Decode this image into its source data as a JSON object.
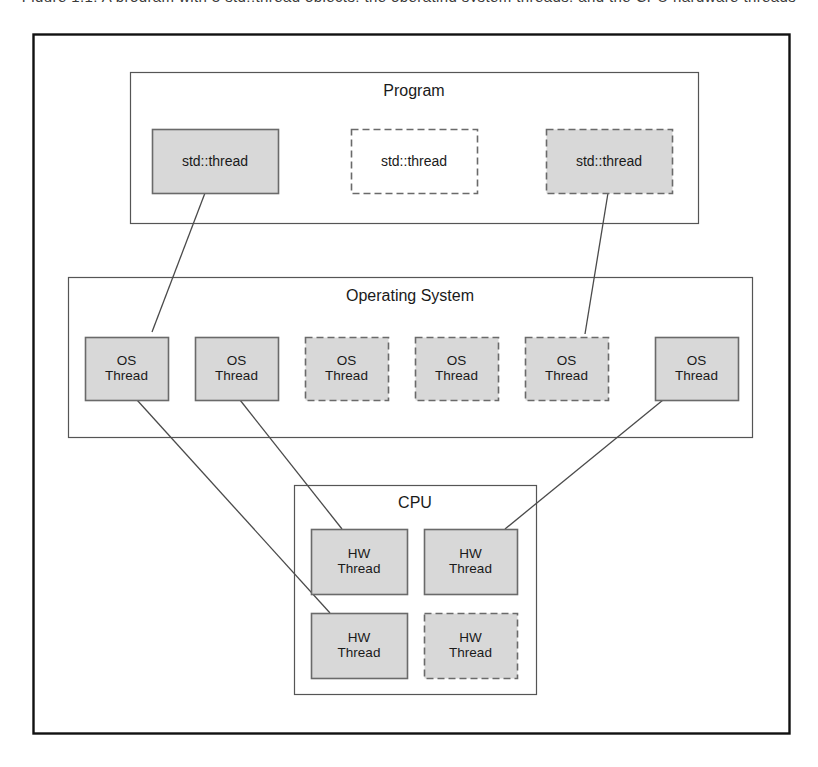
{
  "figure": {
    "caption_remnant": "Figure 1.1: A program with 3 std::thread objects, the operating system threads, and the CPU hardware threads",
    "outer_frame": {
      "x": 33,
      "y": 34,
      "w": 756,
      "h": 699
    }
  },
  "layers": [
    {
      "id": "program",
      "title": "Program",
      "frame": {
        "x": 130,
        "y": 72,
        "w": 568,
        "h": 151
      },
      "title_pos": {
        "x": 130,
        "y": 82,
        "w": 568
      },
      "nodes": [
        {
          "label": "std::thread",
          "style": "solid-filled",
          "x": 152,
          "y": 129,
          "w": 126,
          "h": 64
        },
        {
          "label": "std::thread",
          "style": "dashed-empty",
          "x": 351,
          "y": 129,
          "w": 126,
          "h": 64
        },
        {
          "label": "std::thread",
          "style": "dashed-filled",
          "x": 546,
          "y": 129,
          "w": 126,
          "h": 64
        }
      ]
    },
    {
      "id": "operating-system",
      "title": "Operating System",
      "frame": {
        "x": 68,
        "y": 277,
        "w": 684,
        "h": 160
      },
      "title_pos": {
        "x": 68,
        "y": 287,
        "w": 684
      },
      "nodes": [
        {
          "label_line1": "OS",
          "label_line2": "Thread",
          "style": "solid-filled",
          "x": 85,
          "y": 337,
          "w": 83,
          "h": 63
        },
        {
          "label_line1": "OS",
          "label_line2": "Thread",
          "style": "solid-filled",
          "x": 195,
          "y": 337,
          "w": 83,
          "h": 63
        },
        {
          "label_line1": "OS",
          "label_line2": "Thread",
          "style": "dashed-filled",
          "x": 305,
          "y": 337,
          "w": 83,
          "h": 63
        },
        {
          "label_line1": "OS",
          "label_line2": "Thread",
          "style": "dashed-filled",
          "x": 415,
          "y": 337,
          "w": 83,
          "h": 63
        },
        {
          "label_line1": "OS",
          "label_line2": "Thread",
          "style": "dashed-filled",
          "x": 525,
          "y": 337,
          "w": 83,
          "h": 63
        },
        {
          "label_line1": "OS",
          "label_line2": "Thread",
          "style": "solid-filled",
          "x": 655,
          "y": 337,
          "w": 83,
          "h": 63
        }
      ]
    },
    {
      "id": "cpu",
      "title": "CPU",
      "frame": {
        "x": 294,
        "y": 485,
        "w": 242,
        "h": 209
      },
      "title_pos": {
        "x": 294,
        "y": 494,
        "w": 242
      },
      "nodes": [
        {
          "label_line1": "HW",
          "label_line2": "Thread",
          "style": "solid-filled",
          "x": 311,
          "y": 529,
          "w": 96,
          "h": 65
        },
        {
          "label_line1": "HW",
          "label_line2": "Thread",
          "style": "solid-filled",
          "x": 424,
          "y": 529,
          "w": 93,
          "h": 65
        },
        {
          "label_line1": "HW",
          "label_line2": "Thread",
          "style": "solid-filled",
          "x": 311,
          "y": 613,
          "w": 96,
          "h": 65
        },
        {
          "label_line1": "HW",
          "label_line2": "Thread",
          "style": "dashed-filled",
          "x": 424,
          "y": 613,
          "w": 93,
          "h": 65
        }
      ]
    }
  ],
  "connections": [
    {
      "name": "stdthread1-to-osthread1",
      "x1": 205,
      "y1": 193,
      "x2": 152,
      "y2": 332
    },
    {
      "name": "stdthread3-to-osthread5",
      "x1": 608,
      "y1": 193,
      "x2": 585,
      "y2": 334
    },
    {
      "name": "osthread1-to-hwthread3",
      "x1": 137,
      "y1": 400,
      "x2": 330,
      "y2": 613
    },
    {
      "name": "osthread2-to-hwthread1",
      "x1": 240,
      "y1": 400,
      "x2": 342,
      "y2": 529
    },
    {
      "name": "osthread6-to-hwthread2",
      "x1": 663,
      "y1": 400,
      "x2": 505,
      "y2": 529
    }
  ],
  "colors": {
    "outer_border": "#111111",
    "container_border": "#555555",
    "node_fill": "#d8d8d8",
    "node_border": "#6a6a6a",
    "empty_fill": "#ffffff",
    "connector": "#4a4a4a",
    "text": "#1a1a1a"
  }
}
